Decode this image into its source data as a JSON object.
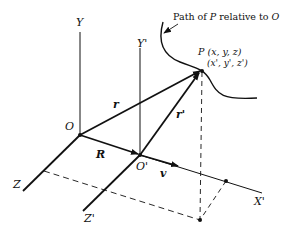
{
  "diagram": {
    "caption": "Path of P relative to O",
    "point": {
      "name": "P",
      "coords": "(x, y, z)",
      "coords_prime": "(x', y', z')"
    },
    "origins": {
      "O": "O",
      "O_prime": "O'"
    },
    "axes": {
      "Y": "Y",
      "Y_prime": "Y'",
      "Z": "Z",
      "Z_prime": "Z'",
      "X_prime": "X'"
    },
    "vectors": {
      "r": "r",
      "r_prime": "r'",
      "R": "R",
      "v": "v"
    },
    "colors": {
      "ink": "#111111",
      "background": "#ffffff"
    }
  }
}
